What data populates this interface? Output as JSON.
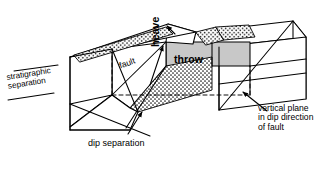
{
  "figure": {
    "type": "geological block diagram",
    "background_color": "#ffffff",
    "line_color": "#000000",
    "gray_fill": "#c8c8c8",
    "stipple_fill": "#ffffff"
  },
  "labels": {
    "stratigraphic_separation": "stratigraphic separation",
    "fault": "fault",
    "heave": "heave",
    "throw": "throw",
    "dip_separation": "dip separation",
    "vertical_plane": "vertical plane in dip direction of fault"
  },
  "icons": {
    "dip_arrow": "arrow-up-icon",
    "heave_arrow": "arrow-up-icon",
    "vertical_plane_arrow": "arrow-up-left-icon"
  }
}
